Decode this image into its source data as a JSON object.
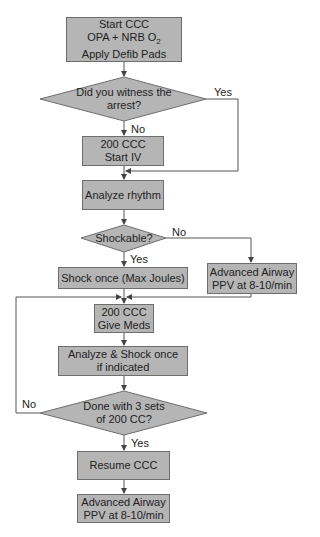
{
  "flowchart": {
    "nodes": [
      {
        "id": "start",
        "type": "process",
        "lines": [
          "Start CCC",
          "OPA + NRB O",
          "Apply Defib Pads"
        ],
        "subscript": "2"
      },
      {
        "id": "witness",
        "type": "decision",
        "lines": [
          "Did you witness the",
          "arrest?"
        ]
      },
      {
        "id": "ccc_iv",
        "type": "process",
        "lines": [
          "200 CCC",
          "Start IV"
        ]
      },
      {
        "id": "analyze",
        "type": "process",
        "lines": [
          "Analyze rhythm"
        ]
      },
      {
        "id": "shockable",
        "type": "decision",
        "lines": [
          "Shockable?"
        ]
      },
      {
        "id": "shock",
        "type": "process",
        "lines": [
          "Shock once (Max Joules)"
        ]
      },
      {
        "id": "airway1",
        "type": "process",
        "lines": [
          "Advanced Airway",
          "PPV at 8-10/min"
        ]
      },
      {
        "id": "meds",
        "type": "process",
        "lines": [
          "200 CCC",
          "Give Meds"
        ]
      },
      {
        "id": "analyze_shock",
        "type": "process",
        "lines": [
          "Analyze & Shock once",
          "if indicated"
        ]
      },
      {
        "id": "done",
        "type": "decision",
        "lines": [
          "Done with 3 sets",
          "of 200 CC?"
        ]
      },
      {
        "id": "resume",
        "type": "process",
        "lines": [
          "Resume CCC"
        ]
      },
      {
        "id": "airway2",
        "type": "process",
        "lines": [
          "Advanced Airway",
          "PPV at 8-10/min"
        ]
      }
    ],
    "edge_labels": {
      "witness_yes": "Yes",
      "witness_no": "No",
      "shockable_no": "No",
      "shockable_yes": "Yes",
      "done_no": "No",
      "done_yes": "Yes"
    },
    "colors": {
      "fill": "#b5b5b5",
      "stroke": "#6e6e6e",
      "line": "#555555"
    }
  }
}
